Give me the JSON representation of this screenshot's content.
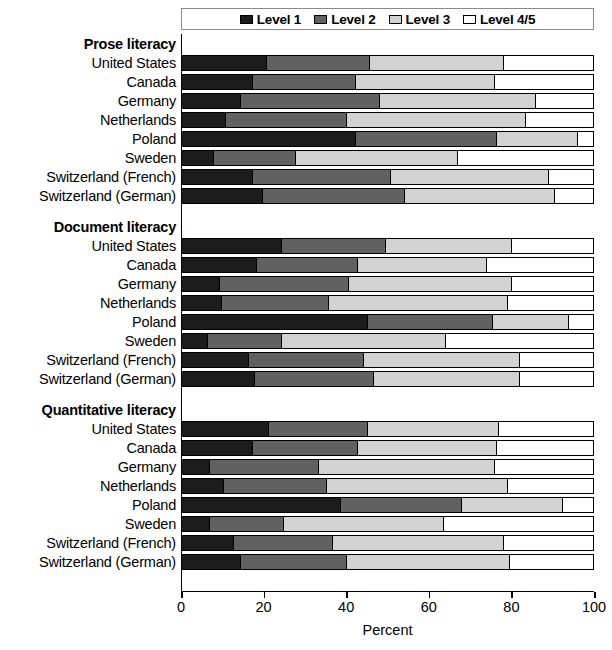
{
  "chart_data": {
    "type": "bar",
    "subtype": "stacked-horizontal-grouped",
    "title": "",
    "xlabel": "Percent",
    "ylabel": "",
    "xlim": [
      0,
      100
    ],
    "xticks": [
      0,
      20,
      40,
      60,
      80,
      100
    ],
    "grid": false,
    "legend_position": "top-center",
    "series": [
      {
        "name": "Level 1",
        "color": "#1c1c1c"
      },
      {
        "name": "Level 2",
        "color": "#616161"
      },
      {
        "name": "Level 3",
        "color": "#d2d2d2"
      },
      {
        "name": "Level 4/5",
        "color": "#ffffff"
      }
    ],
    "groups": [
      {
        "label": "Prose literacy",
        "categories": [
          "United States",
          "Canada",
          "Germany",
          "Netherlands",
          "Poland",
          "Sweden",
          "Switzerland (French)",
          "Switzerland (German)"
        ],
        "values": [
          [
            20.5,
            25.0,
            32.5,
            22.0
          ],
          [
            17.0,
            25.0,
            34.0,
            24.0
          ],
          [
            14.0,
            34.0,
            38.0,
            14.0
          ],
          [
            10.5,
            29.5,
            43.5,
            16.5
          ],
          [
            42.0,
            34.5,
            19.5,
            4.0
          ],
          [
            7.5,
            20.0,
            39.5,
            33.0
          ],
          [
            17.0,
            33.5,
            38.5,
            11.0
          ],
          [
            19.5,
            34.5,
            36.5,
            9.5
          ]
        ]
      },
      {
        "label": "Document literacy",
        "categories": [
          "United States",
          "Canada",
          "Germany",
          "Netherlands",
          "Poland",
          "Sweden",
          "Switzerland (French)",
          "Switzerland (German)"
        ],
        "values": [
          [
            24.0,
            25.5,
            30.5,
            20.0
          ],
          [
            18.0,
            24.5,
            31.5,
            26.0
          ],
          [
            9.0,
            31.5,
            39.5,
            20.0
          ],
          [
            9.5,
            26.0,
            43.5,
            21.0
          ],
          [
            45.0,
            30.5,
            18.5,
            6.0
          ],
          [
            6.0,
            18.0,
            40.0,
            36.0
          ],
          [
            16.0,
            28.0,
            38.0,
            18.0
          ],
          [
            17.5,
            29.0,
            35.5,
            18.0
          ]
        ]
      },
      {
        "label": "Quantitative literacy",
        "categories": [
          "United States",
          "Canada",
          "Germany",
          "Netherlands",
          "Poland",
          "Sweden",
          "Switzerland (French)",
          "Switzerland (German)"
        ],
        "values": [
          [
            21.0,
            24.0,
            32.0,
            23.0
          ],
          [
            17.0,
            25.5,
            34.0,
            23.5
          ],
          [
            6.5,
            26.5,
            43.0,
            24.0
          ],
          [
            10.0,
            25.0,
            44.0,
            21.0
          ],
          [
            38.5,
            29.5,
            24.5,
            7.5
          ],
          [
            6.5,
            18.0,
            39.0,
            36.5
          ],
          [
            12.5,
            24.0,
            41.5,
            22.0
          ],
          [
            14.0,
            26.0,
            39.5,
            20.5
          ]
        ]
      }
    ]
  },
  "legend": {
    "items": [
      {
        "label": "Level 1"
      },
      {
        "label": "Level 2"
      },
      {
        "label": "Level 3"
      },
      {
        "label": "Level 4/5"
      }
    ]
  },
  "axis": {
    "title": "Percent",
    "ticks": [
      "0",
      "20",
      "40",
      "60",
      "80",
      "100"
    ]
  }
}
